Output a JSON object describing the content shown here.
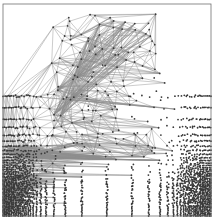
{
  "figure": {
    "kind": "finite-element-mesh",
    "background_color": "#ffffff",
    "edge_color": "#8c8c8c",
    "node_color": "#3a3a3a",
    "boundary_color": "#707070"
  },
  "chart_data": {
    "type": "scatter",
    "subtitle": "",
    "xlabel": "",
    "ylabel": "",
    "xlim": [
      0,
      1
    ],
    "ylim": [
      0,
      1
    ],
    "grid": false,
    "legend": "none",
    "tick_labels_x": [],
    "tick_labels_y": [],
    "annotations": [],
    "domain": {
      "shape": "square",
      "x_min_px": 3,
      "x_max_px": 211,
      "y_min_px": 4,
      "y_max_px": 216
    },
    "mesh": {
      "element_type": "triangle",
      "refinement": "boundary-layer graded",
      "refined_edges": [
        "left",
        "right",
        "bottom"
      ],
      "coarse_edges": [
        "top"
      ],
      "interior": "coarse",
      "grading_ratio": 0.62,
      "layer_count": 22,
      "interior_nodes_per_row": 11,
      "interior_rows": 11,
      "darkest_regions": [
        "bottom-left-corner",
        "bottom-right-corner",
        "bottom-band"
      ],
      "edge_line_width_px": 0.45,
      "node_radius_px": 0.9
    },
    "series": [
      {
        "name": "boundary-layer density (left edge)",
        "x": [
          0.0,
          0.01,
          0.02,
          0.04,
          0.06,
          0.09,
          0.13,
          0.18,
          0.25
        ],
        "values": [
          1.0,
          0.86,
          0.72,
          0.55,
          0.4,
          0.26,
          0.15,
          0.07,
          0.0
        ]
      },
      {
        "name": "boundary-layer density (right edge)",
        "x": [
          1.0,
          0.99,
          0.98,
          0.96,
          0.94,
          0.91,
          0.87,
          0.82,
          0.75
        ],
        "values": [
          1.0,
          0.86,
          0.72,
          0.55,
          0.4,
          0.26,
          0.15,
          0.07,
          0.0
        ]
      },
      {
        "name": "boundary-layer density (bottom edge)",
        "x": [
          0.0,
          0.01,
          0.02,
          0.04,
          0.06,
          0.09,
          0.13,
          0.18,
          0.25
        ],
        "values": [
          1.0,
          0.88,
          0.74,
          0.58,
          0.43,
          0.29,
          0.16,
          0.07,
          0.0
        ]
      },
      {
        "name": "boundary-layer density (top edge)",
        "x": [
          1.0,
          0.98,
          0.95,
          0.9
        ],
        "values": [
          0.05,
          0.02,
          0.0,
          0.0
        ]
      }
    ]
  }
}
